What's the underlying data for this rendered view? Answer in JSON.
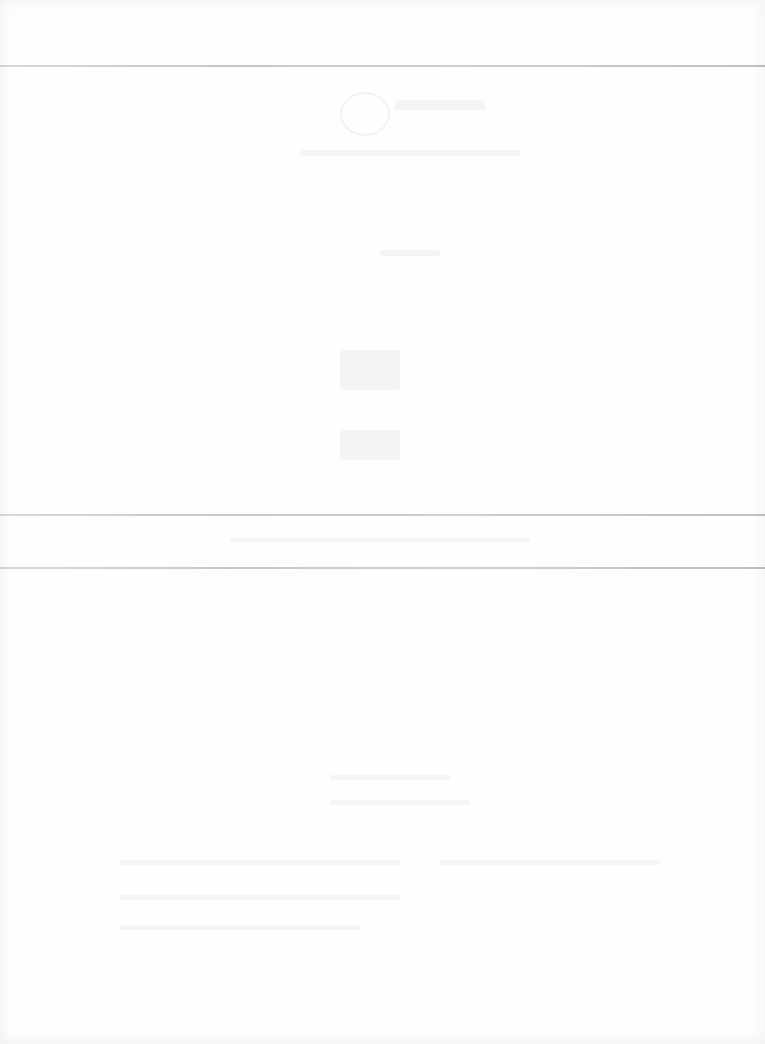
{
  "document": {
    "type": "scanned-page",
    "legibility": "faded",
    "background_color": "#fefefe",
    "rule_color": "#b9b9b9",
    "rules_y": [
      66,
      515,
      568
    ],
    "sections": [
      {
        "name": "top-margin",
        "y": 0,
        "height": 66
      },
      {
        "name": "upper-body",
        "y": 66,
        "height": 449
      },
      {
        "name": "middle-band",
        "y": 515,
        "height": 53
      },
      {
        "name": "lower-body",
        "y": 568,
        "height": 476
      }
    ]
  }
}
